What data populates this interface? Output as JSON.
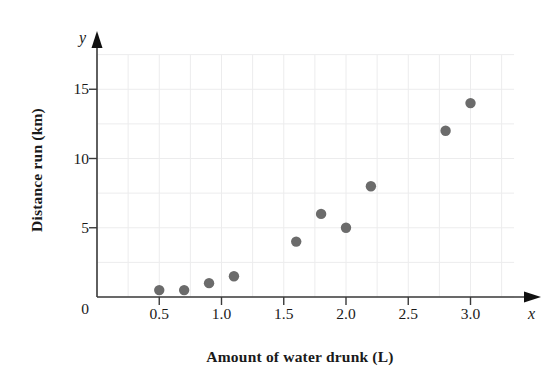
{
  "chart_data": {
    "type": "scatter",
    "title": "",
    "xlabel": "Amount of water drunk (L)",
    "ylabel": "Distance run (km)",
    "x_axis_symbol": "x",
    "y_axis_symbol": "y",
    "xlim": [
      0,
      3.35
    ],
    "ylim": [
      0,
      17.5
    ],
    "xticks": [
      "0.5",
      "1.0",
      "1.5",
      "2.0",
      "2.5",
      "3.0"
    ],
    "xtick_values": [
      0.5,
      1.0,
      1.5,
      2.0,
      2.5,
      3.0
    ],
    "yticks": [
      "0",
      "5",
      "10",
      "15"
    ],
    "ytick_values": [
      0,
      5,
      10,
      15
    ],
    "origin_label": "0",
    "grid": true,
    "grid_x_step": 0.25,
    "grid_y_step": 2.5,
    "grid_color": "#ececed",
    "axis_color": "#3a3a3a",
    "marker_color": "#6b6b6b",
    "marker_radius": 5.2,
    "legend": "none",
    "points": [
      {
        "x": 0.5,
        "y": 0.5
      },
      {
        "x": 0.7,
        "y": 0.5
      },
      {
        "x": 0.9,
        "y": 1.0
      },
      {
        "x": 1.1,
        "y": 1.5
      },
      {
        "x": 1.6,
        "y": 4.0
      },
      {
        "x": 1.8,
        "y": 6.0
      },
      {
        "x": 2.0,
        "y": 5.0
      },
      {
        "x": 2.2,
        "y": 8.0
      },
      {
        "x": 2.8,
        "y": 12.0
      },
      {
        "x": 3.0,
        "y": 14.0
      }
    ]
  }
}
